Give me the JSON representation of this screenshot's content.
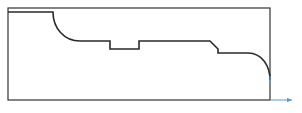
{
  "diagram": {
    "type": "turned-part-profile",
    "colors": {
      "outline": "#333333",
      "profile": "#2a2a2a",
      "axis": "#5b9bd5"
    },
    "stock_rectangle": {
      "x": 8,
      "y": 8,
      "width": 262,
      "height": 92
    },
    "profile_path": "M 8 12 L 53 12 C 53 28 64 41 80 41 L 110 41 L 110 49 L 139 49 L 139 41 L 210 41 L 218 49 L 218 53 L 248 53 C 262 53 270 66 270 80",
    "axis": {
      "origin": {
        "x": 270,
        "y": 100
      },
      "vertical_marker": {
        "x": 270,
        "y1": 76,
        "y2": 84
      },
      "horizontal_arrow": {
        "x1": 270,
        "y1": 100,
        "x2": 292,
        "y2": 100
      }
    }
  }
}
